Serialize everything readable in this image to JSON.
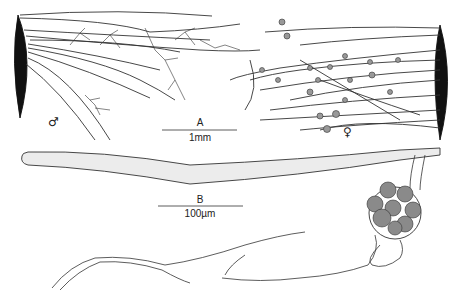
{
  "figure": {
    "panels": [
      {
        "id": "A",
        "label": "A",
        "scale_bar": "1mm",
        "description": "Thallus branches arising from substrate with male (antheridial) and female (oogonial) filaments"
      },
      {
        "id": "B",
        "label": "B",
        "scale_bar": "100µm",
        "description": "Elongate cell with oogonium containing spherical oospores and branching rhizoids"
      }
    ],
    "symbols": {
      "male": "♂",
      "female": "♀"
    },
    "colors": {
      "ink": "#222222",
      "fill_dark": "#111111",
      "cell_fill": "#e8e8e8",
      "oospore": "#8a8a8a"
    }
  }
}
